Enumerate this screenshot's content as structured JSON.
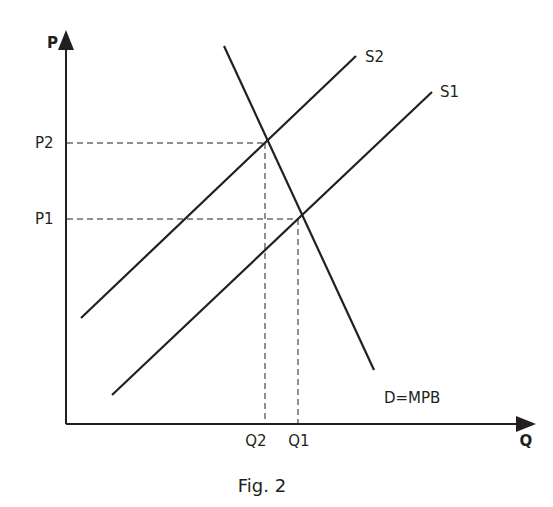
{
  "figure": {
    "caption": "Fig. 2",
    "axes": {
      "y_label": "P",
      "x_label": "Q"
    },
    "price_levels": [
      {
        "label": "P2",
        "y": 143
      },
      {
        "label": "P1",
        "y": 219
      }
    ],
    "quantity_levels": [
      {
        "label": "Q2",
        "x": 265
      },
      {
        "label": "Q1",
        "x": 298
      }
    ],
    "curves": [
      {
        "name": "S2",
        "label": "S2",
        "type": "supply",
        "x1": 81,
        "y1": 318,
        "x2": 356,
        "y2": 56
      },
      {
        "name": "S1",
        "label": "S1",
        "type": "supply",
        "x1": 112,
        "y1": 395,
        "x2": 432,
        "y2": 92
      },
      {
        "name": "D",
        "label": "D=MPB",
        "type": "demand",
        "x1": 224,
        "y1": 46,
        "x2": 374,
        "y2": 370
      }
    ],
    "colors": {
      "ink": "#231f20",
      "background": "#ffffff"
    }
  }
}
